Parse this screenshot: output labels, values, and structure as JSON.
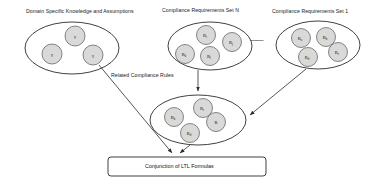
{
  "diagram": {
    "groups": [
      {
        "id": "domain-knowledge",
        "label": "Domain Specific Knowledge and Assumptions",
        "nodes": [
          {
            "id": "dk1",
            "label": "γ",
            "sub": ""
          },
          {
            "id": "dk2",
            "label": "γ",
            "sub": ""
          },
          {
            "id": "dk3",
            "label": "γ",
            "sub": ""
          }
        ]
      },
      {
        "id": "compliance-set-n",
        "label": "Compliance Requirements Set N",
        "nodes": [
          {
            "id": "rn1",
            "label": "R",
            "sub": "i"
          },
          {
            "id": "rn2",
            "label": "R",
            "sub": "j"
          },
          {
            "id": "rn3",
            "label": "R",
            "sub": "k"
          },
          {
            "id": "rn4",
            "label": "R",
            "sub": "l"
          }
        ]
      },
      {
        "id": "compliance-set-1",
        "label": "Compliance Requirements Set 1",
        "nodes": [
          {
            "id": "r11",
            "label": "R",
            "sub": "a"
          },
          {
            "id": "r12",
            "label": "R",
            "sub": "b"
          },
          {
            "id": "r13",
            "label": "R",
            "sub": "c"
          },
          {
            "id": "r14",
            "label": "R",
            "sub": "d"
          }
        ]
      },
      {
        "id": "related-rules",
        "label": "Related Compliance Rules",
        "nodes": [
          {
            "id": "rr1",
            "label": "R",
            "sub": "k"
          },
          {
            "id": "rr2",
            "label": "R",
            "sub": "i"
          },
          {
            "id": "rr3",
            "label": "R",
            "sub": ""
          },
          {
            "id": "rr4",
            "label": "R",
            "sub": "d"
          }
        ]
      }
    ],
    "ellipsis": "——",
    "output_box": {
      "label": "Conjunction of LTL Formulas"
    },
    "colors": {
      "node_fill": "#d9d9d9",
      "stroke": "#2b2b2b",
      "background": "#ffffff"
    }
  }
}
